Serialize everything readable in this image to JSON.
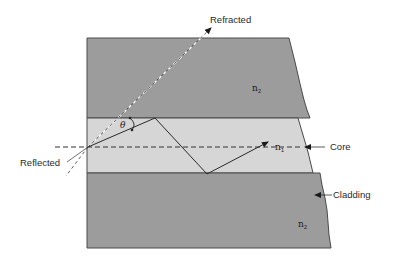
{
  "diagram": {
    "type": "optical-fiber-total-internal-reflection",
    "colors": {
      "cladding": "#9c9c9c",
      "core": "#d6d6d6",
      "edge": "#4a4a4a",
      "ray": "#2a2a2a",
      "background": "#ffffff"
    },
    "labels": {
      "refracted": "Refracted",
      "reflected": "Reflected",
      "core": "Core",
      "cladding": "Cladding",
      "angle": "θ",
      "n_cladding_top": "n",
      "n_cladding_top_sub": "2",
      "n_core": "n",
      "n_core_sub": "1",
      "n_cladding_bottom": "n",
      "n_cladding_bottom_sub": "2"
    },
    "regions": [
      {
        "name": "top-cladding",
        "index": "n2"
      },
      {
        "name": "core",
        "index": "n1"
      },
      {
        "name": "bottom-cladding",
        "index": "n2"
      }
    ]
  }
}
